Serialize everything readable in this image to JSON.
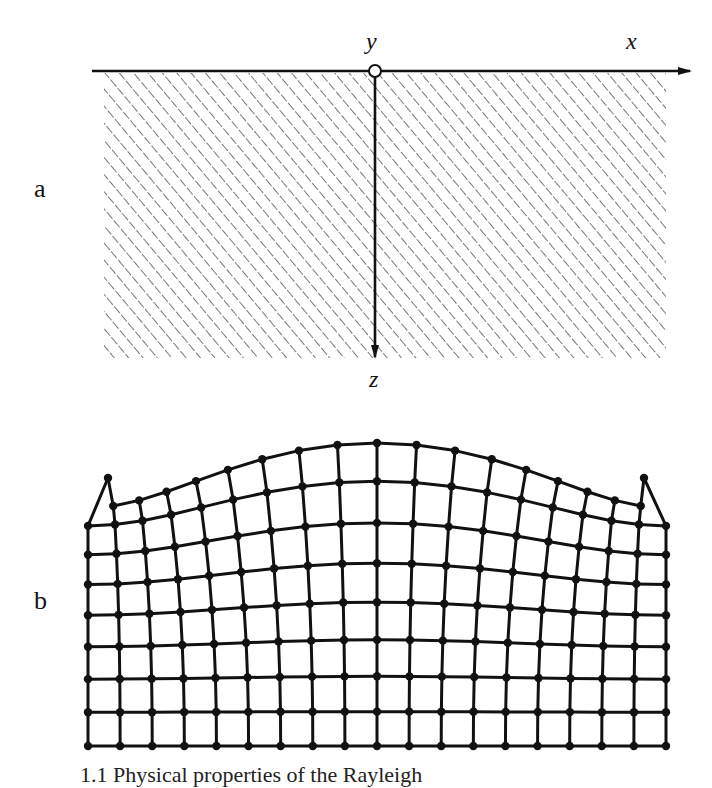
{
  "figure": {
    "panel_a": {
      "label": "a",
      "axes": {
        "x_label": "x",
        "y_label": "y",
        "z_label": "z"
      },
      "description": "Half-space (hatched) below free surface with x axis to the right, y axis into the page at origin, z axis pointing down"
    },
    "panel_b": {
      "label": "b",
      "grid": {
        "columns_nodes": 19,
        "rows_nodes": 9,
        "description": "Deformed grid of material particles showing surface wave (Rayleigh) displacement"
      }
    },
    "caption": "1.1 Physical properties of the Rayleigh"
  },
  "colors": {
    "ink": "#111111",
    "hatch": "#555555",
    "background": "#ffffff"
  }
}
